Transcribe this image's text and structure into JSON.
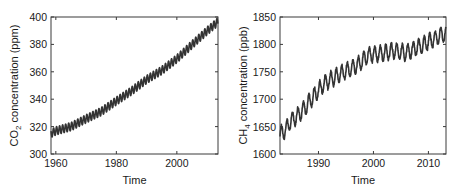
{
  "chart_data": [
    {
      "type": "line",
      "title": "",
      "xlabel": "Time",
      "ylabel": "CO2 concentration (ppm)",
      "ylabel_parts": {
        "pre": "CO",
        "sub": "2",
        "post": " concentration (ppm)"
      },
      "xlim": [
        1958.4,
        2013.6
      ],
      "ylim": [
        300,
        400
      ],
      "xticks": [
        1960,
        1980,
        2000
      ],
      "yticks": [
        300,
        320,
        340,
        360,
        380,
        400
      ],
      "grid": false,
      "legend": null,
      "seasonal_amplitude": 3,
      "series": [
        {
          "name": "CO2 (Mauna Loa)",
          "color": "#333333",
          "x": [
            1958.4,
            1960,
            1965,
            1970,
            1975,
            1980,
            1985,
            1990,
            1995,
            2000,
            2005,
            2010,
            2013.6
          ],
          "values": [
            315,
            316.9,
            320,
            325.7,
            331,
            338.7,
            346,
            354.4,
            361,
            369.5,
            379.8,
            389.9,
            396.5
          ]
        }
      ],
      "frame": {
        "left": 51,
        "top": 17,
        "right": 218,
        "bottom": 154
      }
    },
    {
      "type": "line",
      "title": "",
      "xlabel": "Time",
      "ylabel": "CH4 concentration (ppb)",
      "ylabel_parts": {
        "pre": "CH",
        "sub": "4",
        "post": " concentration (ppb)"
      },
      "xlim": [
        1983,
        2013.2
      ],
      "ylim": [
        1600,
        1850
      ],
      "xticks": [
        1990,
        2000,
        2010
      ],
      "yticks": [
        1600,
        1650,
        1700,
        1750,
        1800,
        1850
      ],
      "grid": false,
      "legend": null,
      "seasonal_amplitude": 14,
      "series": [
        {
          "name": "CH4",
          "color": "#333333",
          "x": [
            1983,
            1984,
            1985,
            1986,
            1987,
            1988,
            1989,
            1990,
            1991,
            1992,
            1993,
            1994,
            1995,
            1996,
            1997,
            1998,
            1999,
            2000,
            2001,
            2002,
            2003,
            2004,
            2005,
            2006,
            2007,
            2008,
            2009,
            2010,
            2011,
            2012,
            2013.2
          ],
          "values": [
            1635,
            1645,
            1660,
            1668,
            1678,
            1690,
            1705,
            1716,
            1728,
            1735,
            1740,
            1746,
            1752,
            1756,
            1762,
            1770,
            1780,
            1782,
            1783,
            1784,
            1787,
            1789,
            1786,
            1785,
            1790,
            1795,
            1798,
            1805,
            1810,
            1815,
            1820
          ]
        }
      ],
      "frame": {
        "left": 280,
        "top": 17,
        "right": 446,
        "bottom": 154
      }
    }
  ]
}
